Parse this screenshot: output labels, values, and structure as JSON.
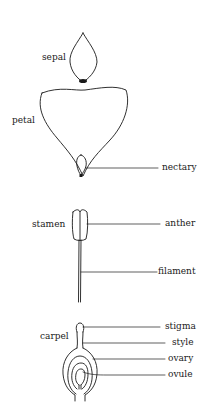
{
  "diagram": {
    "parts": {
      "sepal": "sepal",
      "petal": "petal",
      "nectary": "nectary",
      "stamen": "stamen",
      "anther": "anther",
      "filament": "filament",
      "carpel": "carpel",
      "stigma": "stigma",
      "style": "style",
      "ovary": "ovary",
      "ovule": "ovule"
    },
    "colors": {
      "line": "#1a1a1a",
      "background": "#ffffff"
    }
  }
}
